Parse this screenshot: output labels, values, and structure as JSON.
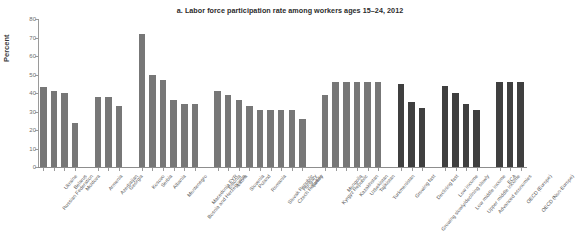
{
  "chart_data": {
    "type": "bar",
    "title": "a. Labor force participation rate among workers ages 15–24, 2012",
    "xlabel": "",
    "ylabel": "Percent",
    "ylim": [
      0,
      80
    ],
    "yticks": [
      0,
      10,
      20,
      30,
      40,
      50,
      60,
      70,
      80
    ],
    "grid": false,
    "legend_position": "none",
    "categories": [
      "Russian Federation",
      "Ukraine",
      "Belarus",
      "Moldova",
      "Armenia",
      "Azerbaijan",
      "Georgia",
      "Kosovo",
      "Serbia",
      "Albania",
      "Montenegro",
      "Bosnia and Herzegovina",
      "Macedonia FYR",
      "Estonia",
      "Latvia",
      "Slovenia",
      "Poland",
      "Romania",
      "Slovak Republic",
      "Czech Republic",
      "Hungary",
      "Turkey",
      "Kyrgyz Republic",
      "Mongolia",
      "Kazakhstan",
      "Uzbekistan",
      "Tajikistan",
      "Turkmenistan",
      "Growing fast",
      "Growing slowly/declining slowly",
      "Declining fast",
      "Low income",
      "Low middle income",
      "Upper middle income",
      "Advanced economies",
      "ECA",
      "OECD (Europe)",
      "OECD (Non-Europe)"
    ],
    "values": [
      43,
      41,
      40,
      24,
      38,
      38,
      33,
      72,
      50,
      47,
      36,
      34,
      34,
      41,
      39,
      36,
      33,
      31,
      31,
      31,
      31,
      26,
      39,
      46,
      46,
      46,
      46,
      46,
      45,
      35,
      32,
      44,
      40,
      34,
      31,
      46,
      46,
      46
    ],
    "bar_styles": [
      "light",
      "light",
      "light",
      "light",
      "light",
      "light",
      "light",
      "light",
      "light",
      "light",
      "light",
      "light",
      "light",
      "light",
      "light",
      "light",
      "light",
      "light",
      "light",
      "light",
      "light",
      "light",
      "light",
      "light",
      "light",
      "light",
      "light",
      "light",
      "dark",
      "dark",
      "dark",
      "dark",
      "dark",
      "dark",
      "dark",
      "dark",
      "dark",
      "dark"
    ],
    "group_breaks_after": [
      3,
      6,
      12,
      21,
      27,
      30,
      34
    ],
    "colors": {
      "bar_light": "#777777",
      "bar_dark": "#3f3f3f",
      "axis": "#9a9a9a",
      "text": "#585858",
      "title": "#2b2b2b"
    }
  }
}
